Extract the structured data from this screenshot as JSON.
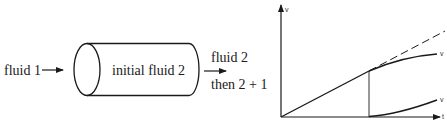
{
  "setup": {
    "inlet_label": "fluid 1",
    "tube_label": "initial fluid 2",
    "outlet_label_line1": "fluid 2",
    "outlet_label_line2": "then 2 + 1"
  },
  "graph": {
    "y_axis_label": "v",
    "x_axis_label": "t",
    "upper_curve_label": "v",
    "lower_curve_label": "v"
  },
  "colors": {
    "ink": "#1a1a1a",
    "background": "#ffffff"
  }
}
